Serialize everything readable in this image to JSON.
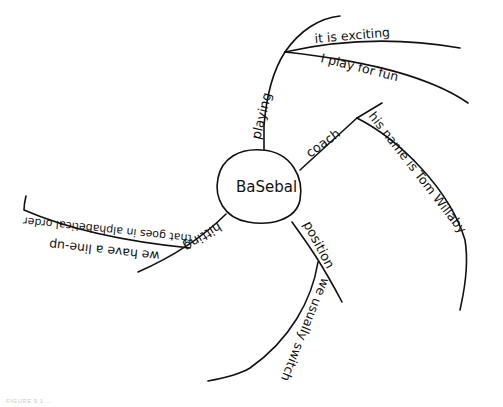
{
  "diagram": {
    "type": "mind-map",
    "style": "hand-drawn",
    "center": {
      "label": "BaSebal"
    },
    "branches": [
      {
        "label": "playing",
        "children": [
          {
            "label": "it is exciting"
          },
          {
            "label": "I play for fun"
          }
        ]
      },
      {
        "label": "coach",
        "children": [
          {
            "label": "his name is Tom Willaby"
          }
        ]
      },
      {
        "label": "position",
        "children": [
          {
            "label": "we usually switch"
          }
        ]
      },
      {
        "label": "hitting",
        "children": [
          {
            "label": "we have a line-up"
          },
          {
            "label": "that goes in alphabetical order"
          }
        ]
      }
    ]
  },
  "caption": {
    "text": "FIGURE 9.1 ..."
  },
  "colors": {
    "ink": "#111111",
    "background": "#ffffff"
  }
}
